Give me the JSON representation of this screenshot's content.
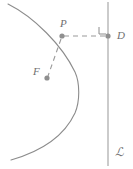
{
  "figure": {
    "name": "parabola-focus-directrix-diagram",
    "background_color": "#ffffff",
    "width": 133,
    "height": 169,
    "stroke_color": "#8c8c8c",
    "point_color": "#8f8f8f",
    "label_color": "#6f6f6f",
    "dash_color": "#9a9a9a"
  },
  "labels": {
    "point_p": "P",
    "point_d": "D",
    "point_f": "F",
    "directrix": "ℒ"
  },
  "points": [
    {
      "name": "P",
      "label": "P",
      "x": 62,
      "y": 36,
      "on": "parabola"
    },
    {
      "name": "D",
      "label": "D",
      "x": 108,
      "y": 36,
      "on": "directrix"
    },
    {
      "name": "F",
      "label": "F",
      "x": 47,
      "y": 78,
      "on": "focus"
    }
  ],
  "segments": [
    {
      "name": "PF",
      "from": "P",
      "to": "F",
      "style": "dashed"
    },
    {
      "name": "PD",
      "from": "P",
      "to": "D",
      "style": "dashed"
    }
  ],
  "curve": {
    "name": "parabola",
    "opens": "left",
    "vertex": {
      "x": 79,
      "y": 92
    },
    "top_end": {
      "x": 8,
      "y": 4
    },
    "bottom_end": {
      "x": 11,
      "y": 160
    },
    "style": "solid"
  },
  "directrix_line": {
    "name": "directrix",
    "x": 108,
    "y_top": 2,
    "y_bottom": 166,
    "style": "solid"
  },
  "right_angle_marker": {
    "name": "right-angle-at-D",
    "x": 99,
    "y": 27,
    "size": 8
  }
}
